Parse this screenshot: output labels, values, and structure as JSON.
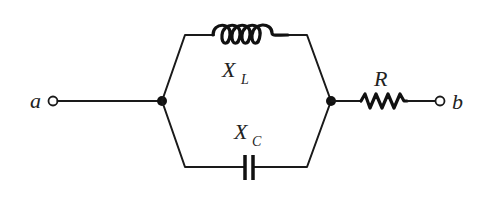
{
  "diagram": {
    "type": "circuit",
    "terminals": [
      {
        "id": "a",
        "label": "a"
      },
      {
        "id": "b",
        "label": "b"
      }
    ],
    "components": [
      {
        "id": "inductor",
        "symbol": "X",
        "subscript": "L",
        "branch": "top-parallel"
      },
      {
        "id": "capacitor",
        "symbol": "X",
        "subscript": "C",
        "branch": "bottom-parallel"
      },
      {
        "id": "resistor",
        "symbol": "R",
        "branch": "series"
      }
    ],
    "colors": {
      "wire": "#1a1a1a",
      "background": "#ffffff"
    }
  }
}
